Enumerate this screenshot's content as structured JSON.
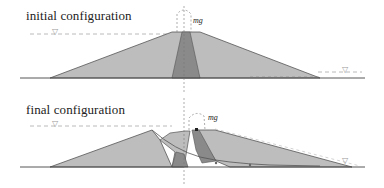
{
  "panels": [
    {
      "id": "initial",
      "title": "initial configuration",
      "weight_label": "mg",
      "water_symbol": "▽"
    },
    {
      "id": "final",
      "title": "final configuration",
      "weight_label": "mg",
      "water_symbol": "▽"
    }
  ],
  "colors": {
    "shell": "#bdbdbd",
    "core": "#8a8a8a",
    "outline": "#555555",
    "dashed": "#9a9a9a",
    "ground": "#444444",
    "text": "#222222"
  }
}
